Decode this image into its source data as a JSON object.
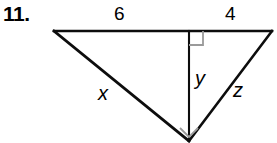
{
  "problem": {
    "number_label": "11.",
    "figure_type": "right-triangle-with-altitude"
  },
  "figure": {
    "labels": {
      "top_left_segment": "6",
      "top_right_segment": "4",
      "left_leg": "x",
      "altitude": "y",
      "right_leg": "z"
    },
    "icons": {
      "top_right_angle": "right-angle-mark-icon",
      "bottom_right_angle": "right-angle-mark-icon"
    },
    "colors": {
      "stroke": "#0d0d0d",
      "angle_mark": "#9a9a9a",
      "background": "#ffffff"
    },
    "geometry": {
      "apex_left": [
        54,
        31
      ],
      "apex_right": [
        272,
        31
      ],
      "vertex_bottom": [
        189,
        141
      ],
      "foot_of_altitude": [
        189,
        31
      ]
    }
  }
}
